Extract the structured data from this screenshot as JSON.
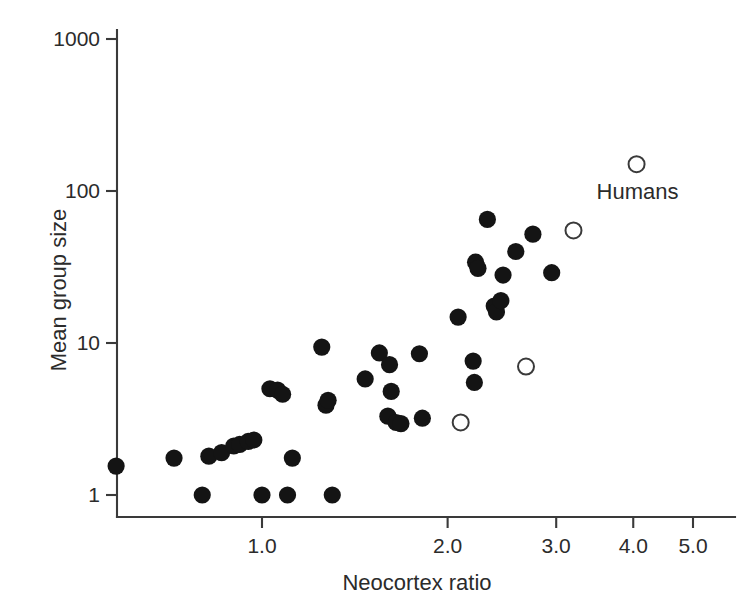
{
  "chart_data": {
    "type": "scatter",
    "title": "",
    "xlabel": "Neocortex ratio",
    "ylabel": "Mean group size",
    "xscale": "log",
    "yscale": "log",
    "xlim": [
      0.5,
      5.3
    ],
    "ylim": [
      0.8,
      1400
    ],
    "grid": false,
    "legend": "none",
    "x_ticks": [
      1.0,
      2.0,
      3.0,
      4.0,
      5.0
    ],
    "x_tick_labels": [
      "1.0",
      "2.0",
      "3.0",
      "4.0",
      "5.0"
    ],
    "y_ticks": [
      1,
      10,
      100,
      1000
    ],
    "y_tick_labels": [
      "1",
      "10",
      "100",
      "1000"
    ],
    "annotations": [
      {
        "text": "Humans",
        "x": 4.05,
        "y": 100
      }
    ],
    "series": [
      {
        "name": "Primate species (filled)",
        "marker": "filled-circle",
        "color": "#141414",
        "points": [
          [
            0.58,
            1.55
          ],
          [
            0.72,
            1.75
          ],
          [
            0.8,
            1.0
          ],
          [
            0.82,
            1.8
          ],
          [
            0.86,
            1.9
          ],
          [
            0.9,
            2.1
          ],
          [
            0.92,
            2.15
          ],
          [
            0.95,
            2.25
          ],
          [
            0.97,
            2.3
          ],
          [
            1.0,
            1.0
          ],
          [
            1.03,
            5.0
          ],
          [
            1.06,
            4.9
          ],
          [
            1.08,
            4.6
          ],
          [
            1.1,
            1.0
          ],
          [
            1.12,
            1.75
          ],
          [
            1.25,
            9.4
          ],
          [
            1.27,
            3.9
          ],
          [
            1.28,
            4.2
          ],
          [
            1.3,
            1.0
          ],
          [
            1.47,
            5.8
          ],
          [
            1.55,
            8.6
          ],
          [
            1.6,
            3.3
          ],
          [
            1.61,
            7.2
          ],
          [
            1.62,
            4.8
          ],
          [
            1.65,
            3.0
          ],
          [
            1.68,
            2.95
          ],
          [
            1.8,
            8.5
          ],
          [
            1.82,
            3.2
          ],
          [
            2.08,
            14.8
          ],
          [
            2.2,
            7.6
          ],
          [
            2.21,
            5.5
          ],
          [
            2.22,
            34.0
          ],
          [
            2.24,
            31.0
          ],
          [
            2.32,
            65.0
          ],
          [
            2.38,
            17.5
          ],
          [
            2.4,
            16.0
          ],
          [
            2.44,
            19.0
          ],
          [
            2.46,
            28.0
          ],
          [
            2.58,
            40.0
          ],
          [
            2.75,
            52.0
          ],
          [
            2.95,
            29.0
          ]
        ]
      },
      {
        "name": "Highlighted species (open)",
        "marker": "open-circle",
        "color": "#ffffff",
        "points": [
          [
            2.1,
            3.0
          ],
          [
            2.68,
            7.0
          ],
          [
            3.2,
            55.0
          ],
          [
            4.05,
            150.0
          ]
        ]
      }
    ]
  },
  "figure": {
    "background_color": "#ffffff",
    "axis_color": "#3a3a3a",
    "text_color": "#2b2b2b"
  }
}
